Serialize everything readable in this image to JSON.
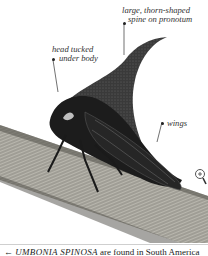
{
  "figure": {
    "labels": [
      {
        "id": "spine",
        "lines": [
          "large, thorn-shaped",
          "spine on pronotum"
        ]
      },
      {
        "id": "head",
        "lines": [
          "head tucked",
          "under body"
        ]
      },
      {
        "id": "wings",
        "lines": [
          "wings"
        ]
      }
    ],
    "zoom_icon": "magnifier-plus-icon"
  },
  "caption": {
    "prefix": "←",
    "scientific_name": "UMBONIA SPINOSA",
    "text": " are found in South America"
  },
  "colors": {
    "background": "#ffffff",
    "insect": "#1c1c1c",
    "branch": "#8a8a80",
    "label_text": "#333333"
  }
}
